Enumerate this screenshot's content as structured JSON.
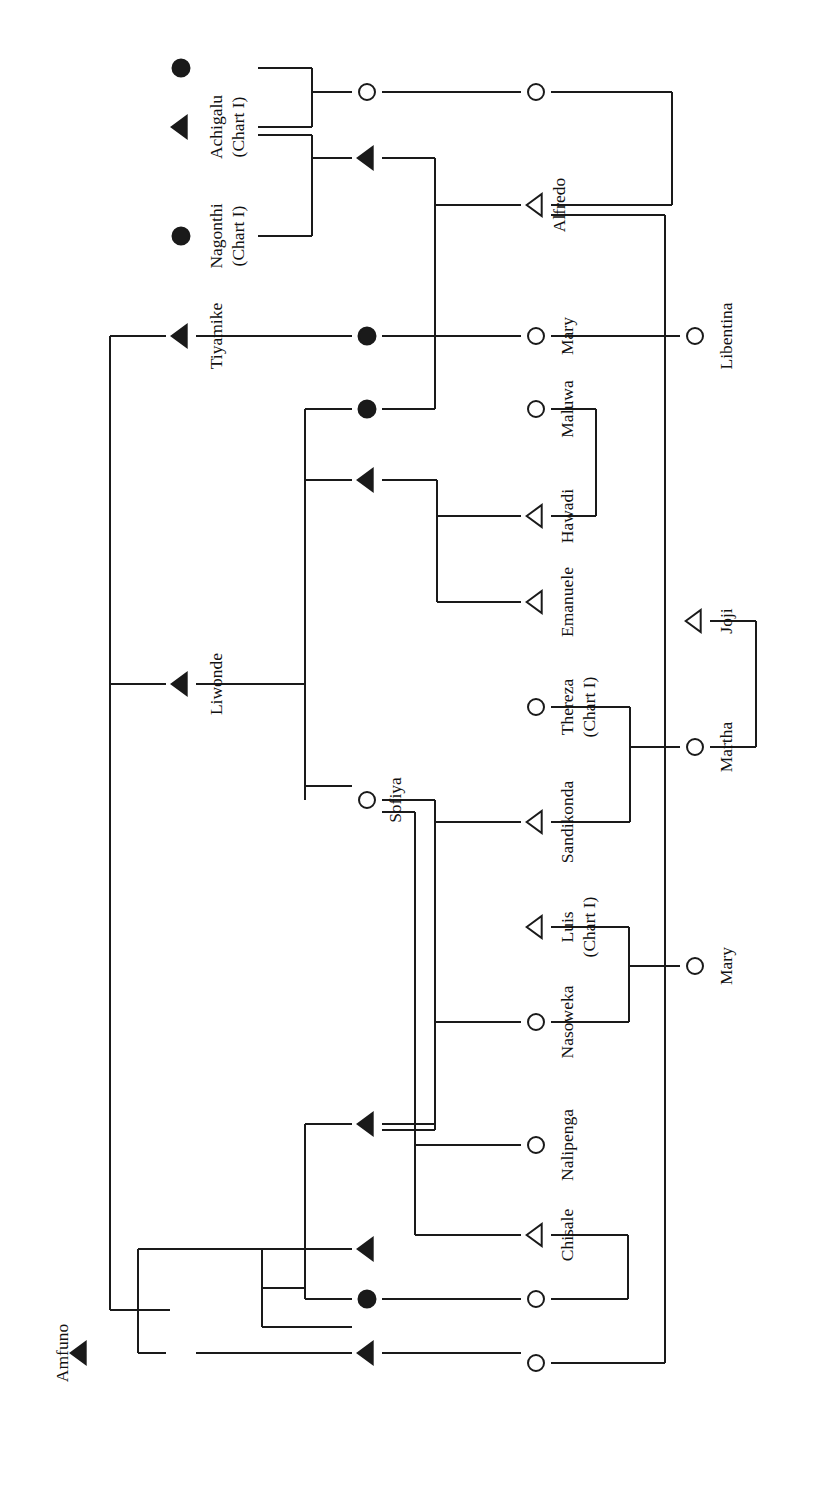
{
  "chart": {
    "title": "",
    "type": "genealogy-kinship-chart",
    "orientation": "rotated-90-ccw",
    "symbol_legend": {
      "filled-triangle": "deceased male",
      "open-triangle": "living male",
      "filled-circle": "deceased female",
      "open-circle": "living female"
    },
    "colors": {
      "line": "#1a1a1a",
      "text": "#111111",
      "background": "#ffffff"
    },
    "persons": [
      {
        "id": "p1",
        "name": "",
        "sub": "",
        "symbol": "filled-circle",
        "x": 181,
        "y": 68
      },
      {
        "id": "p2",
        "name": "Achigalu",
        "sub": "(Chart I)",
        "symbol": "filled-triangle",
        "x": 181,
        "y": 127
      },
      {
        "id": "p3",
        "name": "Nagonthi",
        "sub": "(Chart I)",
        "symbol": "filled-circle",
        "x": 181,
        "y": 236
      },
      {
        "id": "p4",
        "name": "Tiyamike",
        "sub": "",
        "symbol": "filled-triangle",
        "x": 181,
        "y": 336
      },
      {
        "id": "p5",
        "name": "Liwonde",
        "sub": "",
        "symbol": "filled-triangle",
        "x": 181,
        "y": 684
      },
      {
        "id": "p6",
        "name": "Amfuno",
        "sub": "",
        "symbol": "filled-triangle",
        "x": 80,
        "y": 1353
      },
      {
        "id": "p7",
        "name": "",
        "sub": "",
        "symbol": "open-circle",
        "x": 367,
        "y": 92
      },
      {
        "id": "p8",
        "name": "",
        "sub": "",
        "symbol": "filled-triangle",
        "x": 367,
        "y": 158
      },
      {
        "id": "p9",
        "name": "",
        "sub": "",
        "symbol": "filled-circle",
        "x": 367,
        "y": 336
      },
      {
        "id": "p10",
        "name": "",
        "sub": "",
        "symbol": "filled-circle",
        "x": 367,
        "y": 409
      },
      {
        "id": "p11",
        "name": "",
        "sub": "",
        "symbol": "filled-triangle",
        "x": 367,
        "y": 480
      },
      {
        "id": "p12",
        "name": "Sofiya",
        "sub": "",
        "symbol": "open-circle",
        "x": 367,
        "y": 800
      },
      {
        "id": "p13",
        "name": "",
        "sub": "",
        "symbol": "filled-triangle",
        "x": 367,
        "y": 1124
      },
      {
        "id": "p14",
        "name": "",
        "sub": "",
        "symbol": "filled-triangle",
        "x": 367,
        "y": 1249
      },
      {
        "id": "p15",
        "name": "",
        "sub": "",
        "symbol": "filled-circle",
        "x": 367,
        "y": 1299
      },
      {
        "id": "p16",
        "name": "",
        "sub": "",
        "symbol": "filled-triangle",
        "x": 367,
        "y": 1353
      },
      {
        "id": "p17",
        "name": "",
        "sub": "",
        "symbol": "open-circle",
        "x": 536,
        "y": 92
      },
      {
        "id": "p18",
        "name": "Alfredo",
        "sub": "",
        "symbol": "open-triangle",
        "x": 536,
        "y": 205
      },
      {
        "id": "p19",
        "name": "Mary",
        "sub": "",
        "symbol": "open-circle",
        "x": 536,
        "y": 336
      },
      {
        "id": "p20",
        "name": "Maluwa",
        "sub": "",
        "symbol": "open-circle",
        "x": 536,
        "y": 409
      },
      {
        "id": "p21",
        "name": "Hawadi",
        "sub": "",
        "symbol": "open-triangle",
        "x": 536,
        "y": 516
      },
      {
        "id": "p22",
        "name": "Emanuele",
        "sub": "",
        "symbol": "open-triangle",
        "x": 536,
        "y": 602
      },
      {
        "id": "p23",
        "name": "Thereza",
        "sub": "(Chart I)",
        "symbol": "open-circle",
        "x": 536,
        "y": 707
      },
      {
        "id": "p24",
        "name": "Sandikonda",
        "sub": "",
        "symbol": "open-triangle",
        "x": 536,
        "y": 822
      },
      {
        "id": "p25",
        "name": "Luis",
        "sub": "(Chart I)",
        "symbol": "open-triangle",
        "x": 536,
        "y": 927
      },
      {
        "id": "p26",
        "name": "Nasoweka",
        "sub": "",
        "symbol": "open-circle",
        "x": 536,
        "y": 1022
      },
      {
        "id": "p27",
        "name": "Nalipenga",
        "sub": "",
        "symbol": "open-circle",
        "x": 536,
        "y": 1145
      },
      {
        "id": "p28",
        "name": "Chisale",
        "sub": "",
        "symbol": "open-triangle",
        "x": 536,
        "y": 1235
      },
      {
        "id": "p29",
        "name": "",
        "sub": "",
        "symbol": "open-circle",
        "x": 536,
        "y": 1299
      },
      {
        "id": "p30",
        "name": "",
        "sub": "",
        "symbol": "open-circle",
        "x": 536,
        "y": 1363
      },
      {
        "id": "p31",
        "name": "Libentina",
        "sub": "",
        "symbol": "open-circle",
        "x": 695,
        "y": 336
      },
      {
        "id": "p32",
        "name": "Joji",
        "sub": "",
        "symbol": "open-triangle",
        "x": 695,
        "y": 621
      },
      {
        "id": "p33",
        "name": "Martha",
        "sub": "",
        "symbol": "open-circle",
        "x": 695,
        "y": 747
      },
      {
        "id": "p34",
        "name": "Mary",
        "sub": "",
        "symbol": "open-circle",
        "x": 695,
        "y": 966
      }
    ],
    "labels": [
      {
        "text": "Achigalu",
        "x": 216,
        "y": 127
      },
      {
        "text": "(Chart I)",
        "x": 238,
        "y": 127
      },
      {
        "text": "Nagonthi",
        "x": 216,
        "y": 236
      },
      {
        "text": "(Chart I)",
        "x": 238,
        "y": 236
      },
      {
        "text": "Tiyamike",
        "x": 216,
        "y": 336
      },
      {
        "text": "Liwonde",
        "x": 216,
        "y": 684
      },
      {
        "text": "Amfuno",
        "x": 62,
        "y": 1353
      },
      {
        "text": "Sofiya",
        "x": 395,
        "y": 800
      },
      {
        "text": "Alfredo",
        "x": 559,
        "y": 205
      },
      {
        "text": "Mary",
        "x": 567,
        "y": 336
      },
      {
        "text": "Maluwa",
        "x": 567,
        "y": 409
      },
      {
        "text": "Hawadi",
        "x": 567,
        "y": 516
      },
      {
        "text": "Emanuele",
        "x": 567,
        "y": 602
      },
      {
        "text": "Thereza",
        "x": 567,
        "y": 707
      },
      {
        "text": "(Chart I)",
        "x": 589,
        "y": 707
      },
      {
        "text": "Sandikonda",
        "x": 567,
        "y": 822
      },
      {
        "text": "Luis",
        "x": 567,
        "y": 927
      },
      {
        "text": "(Chart I)",
        "x": 589,
        "y": 927
      },
      {
        "text": "Nasoweka",
        "x": 567,
        "y": 1022
      },
      {
        "text": "Nalipenga",
        "x": 567,
        "y": 1145
      },
      {
        "text": "Chisale",
        "x": 567,
        "y": 1235
      },
      {
        "text": "Libentina",
        "x": 726,
        "y": 336
      },
      {
        "text": "Joji",
        "x": 726,
        "y": 621
      },
      {
        "text": "Martha",
        "x": 726,
        "y": 747
      },
      {
        "text": "Mary",
        "x": 726,
        "y": 966
      }
    ],
    "lines": [
      {
        "d": "M 258 68 L 312 68",
        "name": "link-p1-bracket"
      },
      {
        "d": "M 258 127 L 312 127",
        "name": "link-p2-bracket"
      },
      {
        "d": "M 312 68 L 312 127",
        "name": "bracket-union-1"
      },
      {
        "d": "M 312 92 L 352 92",
        "name": "link-union1-p7"
      },
      {
        "d": "M 258 135 L 312 135",
        "name": "link-p2b-bracket2"
      },
      {
        "d": "M 258 236 L 312 236",
        "name": "link-p3-bracket2"
      },
      {
        "d": "M 312 135 L 312 236",
        "name": "bracket-union-2"
      },
      {
        "d": "M 312 158 L 352 158",
        "name": "link-union2-p8"
      },
      {
        "d": "M 382 92 L 521 92",
        "name": "link-p7-p17"
      },
      {
        "d": "M 551 92 L 672 92",
        "name": "link-p17-bracket3"
      },
      {
        "d": "M 551 205 L 672 205",
        "name": "link-p18-bracket3"
      },
      {
        "d": "M 672 92 L 672 205",
        "name": "bracket-union-3"
      },
      {
        "d": "M 551 215 L 665 215",
        "name": "link-p18-longvert"
      },
      {
        "d": "M 665 215 L 665 1363",
        "name": "long-vertical-right"
      },
      {
        "d": "M 665 1363 L 551 1363",
        "name": "link-longvert-p30"
      },
      {
        "d": "M 382 158 L 435 158",
        "name": "link-p8-vert"
      },
      {
        "d": "M 435 158 L 435 409",
        "name": "vertical-descent-1"
      },
      {
        "d": "M 435 205 L 521 205",
        "name": "link-vert-p18"
      },
      {
        "d": "M 435 409 L 382 409",
        "name": "link-vert-p10"
      },
      {
        "d": "M 110 336 L 166 336",
        "name": "link-vert-left-p4"
      },
      {
        "d": "M 196 336 L 352 336",
        "name": "link-p4-p9"
      },
      {
        "d": "M 382 336 L 521 336",
        "name": "link-p9-p19"
      },
      {
        "d": "M 551 336 L 680 336",
        "name": "link-p19-p31"
      },
      {
        "d": "M 110 336 L 110 1310",
        "name": "long-vertical-left"
      },
      {
        "d": "M 110 684 L 166 684",
        "name": "link-leftvert-p5"
      },
      {
        "d": "M 196 684 L 305 684",
        "name": "link-p5-vert2"
      },
      {
        "d": "M 305 409 L 305 800",
        "name": "vertical-descent-2"
      },
      {
        "d": "M 305 409 L 352 409",
        "name": "link-vert2-p10"
      },
      {
        "d": "M 305 480 L 352 480",
        "name": "link-vert2-p11"
      },
      {
        "d": "M 305 786 L 352 786",
        "name": "link-vert2-p12"
      },
      {
        "d": "M 382 480 L 437 480",
        "name": "link-p11-vert3"
      },
      {
        "d": "M 437 480 L 437 602",
        "name": "vertical-descent-3"
      },
      {
        "d": "M 437 516 L 521 516",
        "name": "link-vert3-p21"
      },
      {
        "d": "M 437 602 L 521 602",
        "name": "link-vert3-p22"
      },
      {
        "d": "M 551 409 L 596 409",
        "name": "link-p20-bracket4"
      },
      {
        "d": "M 551 516 L 596 516",
        "name": "link-p21-bracket4"
      },
      {
        "d": "M 596 409 L 596 516",
        "name": "bracket-union-4"
      },
      {
        "d": "M 382 800 L 435 800",
        "name": "link-p12-vert4"
      },
      {
        "d": "M 435 800 L 435 1130",
        "name": "vertical-descent-4"
      },
      {
        "d": "M 435 822 L 521 822",
        "name": "link-vert4-p24"
      },
      {
        "d": "M 435 1022 L 521 1022",
        "name": "link-vert4-p26"
      },
      {
        "d": "M 435 1130 L 382 1130",
        "name": "link-vert4-p13"
      },
      {
        "d": "M 382 812 L 415 812",
        "name": "link-p12-vert5"
      },
      {
        "d": "M 415 812 L 415 1145",
        "name": "vertical-descent-5"
      },
      {
        "d": "M 415 1145 L 521 1145",
        "name": "link-vert5-p27"
      },
      {
        "d": "M 415 1235 L 521 1235",
        "name": "link-vert5-p28"
      },
      {
        "d": "M 415 1145 L 415 1235",
        "name": "vertical-descent-5b"
      },
      {
        "d": "M 551 707 L 630 707",
        "name": "link-p23-bracket5"
      },
      {
        "d": "M 551 822 L 630 822",
        "name": "link-p24-bracket5"
      },
      {
        "d": "M 630 707 L 630 822",
        "name": "bracket-union-5"
      },
      {
        "d": "M 630 747 L 680 747",
        "name": "link-union5-p33"
      },
      {
        "d": "M 710 747 L 756 747",
        "name": "link-p33-bracket6"
      },
      {
        "d": "M 710 621 L 756 621",
        "name": "link-p32-bracket6"
      },
      {
        "d": "M 756 621 L 756 747",
        "name": "bracket-union-6"
      },
      {
        "d": "M 551 927 L 629 927",
        "name": "link-p25-bracket7"
      },
      {
        "d": "M 551 1022 L 629 1022",
        "name": "link-p26-bracket7"
      },
      {
        "d": "M 629 927 L 629 1022",
        "name": "bracket-union-7"
      },
      {
        "d": "M 629 966 L 680 966",
        "name": "link-union7-p34"
      },
      {
        "d": "M 551 1235 L 628 1235",
        "name": "link-p28-bracket8"
      },
      {
        "d": "M 551 1299 L 628 1299",
        "name": "link-p29-bracket8"
      },
      {
        "d": "M 628 1235 L 628 1299",
        "name": "bracket-union-8"
      },
      {
        "d": "M 382 1124 L 435 1124",
        "name": "link-p13-vert4b"
      },
      {
        "d": "M 305 1124 L 352 1124",
        "name": "link-p13-left"
      },
      {
        "d": "M 305 1124 L 305 1299",
        "name": "vertical-descent-6"
      },
      {
        "d": "M 305 1249 L 352 1249",
        "name": "link-vert6-p14"
      },
      {
        "d": "M 305 1299 L 352 1299",
        "name": "link-vert6-p15"
      },
      {
        "d": "M 382 1299 L 521 1299",
        "name": "link-p15-p29"
      },
      {
        "d": "M 382 1353 L 521 1353",
        "name": "link-p16-p30bar"
      },
      {
        "d": "M 110 1310 L 170 1310",
        "name": "link-leftvert-bottom"
      },
      {
        "d": "M 138 1249 L 138 1353",
        "name": "vertical-bottom-left"
      },
      {
        "d": "M 138 1249 L 352 1249",
        "name": "link-bottomvert-p14"
      },
      {
        "d": "M 138 1353 L 166 1353",
        "name": "link-bottomvert-p6"
      },
      {
        "d": "M 196 1353 L 352 1353",
        "name": "link-p6-p16row"
      },
      {
        "d": "M 262 1249 L 262 1327",
        "name": "bracket-union-9-left"
      },
      {
        "d": "M 262 1249 L 352 1249",
        "name": "bracket-union-9-top"
      },
      {
        "d": "M 262 1327 L 352 1327",
        "name": "bracket-union-9-bot"
      },
      {
        "d": "M 262 1288 L 305 1288",
        "name": "link-union9-out"
      },
      {
        "d": "M 110 1310 L 110 1310",
        "name": "noop"
      }
    ]
  }
}
